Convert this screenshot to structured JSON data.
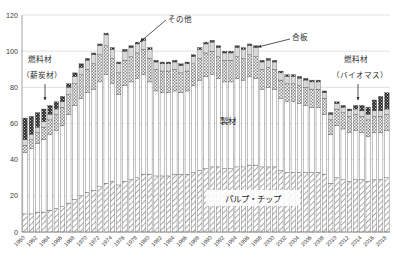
{
  "chart": {
    "type": "bar",
    "title": "",
    "xlabel": "",
    "ylabel": "",
    "axis": {
      "y_ticks": [
        "0",
        "20",
        "40",
        "60",
        "80",
        "100",
        "120"
      ],
      "ylim": [
        0,
        120
      ],
      "grid": true,
      "legend_position": "in-plot-annotations"
    },
    "annotations": [
      {
        "name": "fuel-wood-firewood",
        "line1": "燃料材",
        "line2": "（薪炭材）"
      },
      {
        "name": "other",
        "text": "その他"
      },
      {
        "name": "plywood",
        "text": "合板"
      },
      {
        "name": "fuel-wood-biomass",
        "line1": "燃料材",
        "line2": "（バイオマス）"
      },
      {
        "name": "sawnwood",
        "text": "製材"
      },
      {
        "name": "pulp-chips",
        "text": "パルプ・チップ"
      }
    ]
  },
  "chart_data": {
    "type": "bar",
    "stacked": true,
    "title": "",
    "xlabel": "",
    "ylabel": "",
    "ylim": [
      0,
      120
    ],
    "yticks": [
      0,
      20,
      40,
      60,
      80,
      100,
      120
    ],
    "grid": true,
    "legend": [
      "パルプ・チップ",
      "製材",
      "合板",
      "その他",
      "燃料材"
    ],
    "legend_position": "in-plot annotations with leader lines",
    "categories": [
      1960,
      1961,
      1962,
      1963,
      1964,
      1965,
      1966,
      1967,
      1968,
      1969,
      1970,
      1971,
      1972,
      1973,
      1974,
      1975,
      1976,
      1977,
      1978,
      1979,
      1980,
      1981,
      1982,
      1983,
      1984,
      1985,
      1986,
      1987,
      1988,
      1989,
      1990,
      1991,
      1992,
      1993,
      1994,
      1995,
      1996,
      1997,
      1998,
      1999,
      2000,
      2001,
      2002,
      2003,
      2004,
      2005,
      2006,
      2007,
      2008,
      2009,
      2010,
      2011,
      2012,
      2013,
      2014,
      2015,
      2016,
      2017,
      2018
    ],
    "xtick_labels": [
      "1960",
      "1962",
      "1964",
      "1966",
      "1968",
      "1970",
      "1972",
      "1974",
      "1976",
      "1978",
      "1980",
      "1982",
      "1984",
      "1986",
      "1988",
      "1990",
      "1992",
      "1994",
      "1996",
      "1998",
      "2000",
      "2002",
      "2004",
      "2006",
      "2008",
      "2010",
      "2012",
      "2014",
      "2016",
      "2018"
    ],
    "xtick_every": 2,
    "series": [
      {
        "name": "パルプ・チップ",
        "pattern": "diagonal-hatch",
        "values": [
          10,
          10,
          11,
          11,
          12,
          13,
          14,
          16,
          18,
          20,
          22,
          23,
          25,
          27,
          28,
          26,
          28,
          29,
          30,
          32,
          32,
          31,
          31,
          31,
          32,
          32,
          32,
          33,
          34,
          35,
          36,
          36,
          35,
          35,
          36,
          36,
          37,
          37,
          36,
          36,
          36,
          34,
          33,
          33,
          33,
          33,
          33,
          33,
          32,
          27,
          30,
          29,
          28,
          29,
          29,
          28,
          29,
          29,
          30
        ]
      },
      {
        "name": "製材",
        "pattern": "solid-white",
        "values": [
          34,
          36,
          38,
          40,
          42,
          43,
          45,
          49,
          52,
          54,
          55,
          56,
          58,
          60,
          54,
          50,
          53,
          54,
          55,
          55,
          51,
          47,
          46,
          46,
          46,
          45,
          46,
          48,
          50,
          51,
          51,
          49,
          48,
          48,
          49,
          48,
          49,
          48,
          43,
          44,
          43,
          40,
          39,
          39,
          38,
          37,
          36,
          36,
          33,
          27,
          29,
          28,
          27,
          27,
          26,
          25,
          26,
          26,
          26
        ]
      },
      {
        "name": "合板",
        "pattern": "checker",
        "values": [
          4,
          5,
          6,
          7,
          8,
          9,
          10,
          11,
          12,
          13,
          13,
          14,
          15,
          16,
          14,
          12,
          14,
          14,
          14,
          14,
          13,
          12,
          12,
          12,
          12,
          11,
          11,
          12,
          12,
          13,
          13,
          12,
          12,
          12,
          12,
          12,
          12,
          12,
          11,
          11,
          11,
          10,
          10,
          10,
          10,
          10,
          10,
          10,
          9,
          8,
          9,
          9,
          9,
          9,
          9,
          9,
          9,
          9,
          9
        ]
      },
      {
        "name": "その他",
        "pattern": "light-gray",
        "values": [
          3,
          3,
          3,
          3,
          3,
          3,
          3,
          4,
          4,
          4,
          5,
          5,
          5,
          6,
          5,
          5,
          5,
          5,
          5,
          5,
          5,
          4,
          4,
          4,
          4,
          4,
          4,
          4,
          5,
          5,
          5,
          5,
          4,
          4,
          5,
          5,
          5,
          5,
          4,
          4,
          4,
          4,
          4,
          4,
          4,
          4,
          4,
          4,
          3,
          3,
          3,
          3,
          3,
          3,
          3,
          3,
          3,
          3,
          3
        ]
      },
      {
        "name": "燃料材",
        "pattern": "dark-dotted",
        "values": [
          12,
          10,
          8,
          7,
          5,
          4,
          3,
          2,
          2,
          2,
          1,
          1,
          1,
          1,
          1,
          1,
          1,
          1,
          1,
          1,
          1,
          1,
          1,
          1,
          1,
          1,
          1,
          1,
          1,
          1,
          1,
          1,
          1,
          1,
          1,
          1,
          1,
          1,
          1,
          1,
          1,
          1,
          1,
          1,
          1,
          1,
          1,
          1,
          1,
          1,
          1,
          1,
          1,
          2,
          3,
          4,
          6,
          8,
          9
        ]
      }
    ],
    "totals": [
      63,
      64,
      66,
      68,
      70,
      72,
      75,
      82,
      88,
      93,
      96,
      99,
      104,
      110,
      102,
      94,
      101,
      103,
      105,
      107,
      102,
      95,
      94,
      94,
      95,
      93,
      94,
      98,
      102,
      105,
      106,
      103,
      100,
      100,
      103,
      102,
      104,
      103,
      95,
      96,
      95,
      89,
      87,
      87,
      86,
      85,
      84,
      84,
      78,
      66,
      72,
      70,
      68,
      70,
      70,
      69,
      73,
      75,
      77
    ]
  }
}
